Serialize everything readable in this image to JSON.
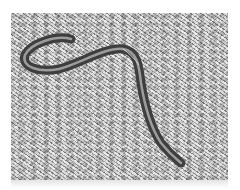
{
  "image": {
    "subject": "snake on frosty grass",
    "description": "Grayscale photograph of a slender striped snake curving across white frosted grass",
    "colors": {
      "background": "#ffffff",
      "grass_light": "#e6e6e6",
      "grass_dark": "#7d7d7d",
      "snake_body": "#4a4a4a",
      "snake_stripe": "#9c9c9c"
    }
  }
}
